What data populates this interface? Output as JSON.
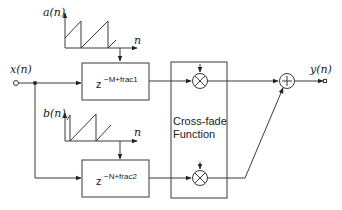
{
  "diagram": {
    "type": "block-diagram",
    "input": {
      "label": "x(n)"
    },
    "output": {
      "label": "y(n)"
    },
    "control_signals": [
      {
        "id": "a",
        "label": "a(n)",
        "axis_label": "n",
        "shape": "sawtooth"
      },
      {
        "id": "b",
        "label": "b(n)",
        "axis_label": "n",
        "shape": "sawtooth"
      }
    ],
    "delay_blocks": [
      {
        "id": "delay1",
        "base": "z",
        "exponent": "−M+frac1"
      },
      {
        "id": "delay2",
        "base": "z",
        "exponent": "−N+frac2"
      }
    ],
    "crossfade": {
      "label_line1": "Cross-fade",
      "label_line2": "Function"
    },
    "multipliers": [
      {
        "id": "mult1",
        "symbol": "×"
      },
      {
        "id": "mult2",
        "symbol": "×"
      }
    ],
    "adder": {
      "symbol": "+"
    },
    "colors": {
      "stroke": "#3a3a3a",
      "text": "#222222",
      "background": "#ffffff"
    }
  }
}
